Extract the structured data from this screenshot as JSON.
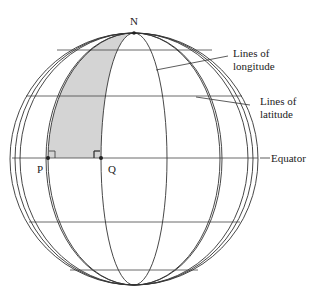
{
  "diagram": {
    "labels": {
      "north": "N",
      "point_p": "P",
      "point_q": "Q",
      "longitude_line1": "Lines of",
      "longitude_line2": "longitude",
      "latitude_line1": "Lines of",
      "latitude_line2": "latitude",
      "equator": "Equator"
    },
    "colors": {
      "stroke": "#333333",
      "shaded_region": "#d4d4d4",
      "background": "#ffffff"
    },
    "annotations": {
      "right_angle_at_p": true,
      "right_angle_at_q": true,
      "shaded_region": "Region bounded by meridians through P and Q, north of the equator, up to pole N"
    }
  }
}
